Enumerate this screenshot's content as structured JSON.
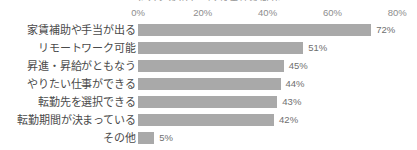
{
  "chart_data": {
    "type": "bar",
    "orientation": "horizontal",
    "title": "たらくないで…べき条件は何か",
    "xlabel": "",
    "ylabel": "",
    "xlim": [
      0,
      80
    ],
    "grid": false,
    "legend": null,
    "value_suffix": "%",
    "categories": [
      "家賃補助や手当が出る",
      "リモートワーク可能",
      "昇進・昇給がともなう",
      "やりたい仕事ができる",
      "転勤先を選択できる",
      "転勤期間が決まっている",
      "その他"
    ],
    "values": [
      72,
      51,
      45,
      44,
      43,
      42,
      5
    ],
    "value_labels": [
      "72%",
      "51%",
      "45%",
      "44%",
      "43%",
      "42%",
      "5%"
    ],
    "xticks": [
      0,
      20,
      40,
      60,
      80
    ],
    "xtick_labels": [
      "0%",
      "20%",
      "40%",
      "60%",
      "80%"
    ],
    "colors": {
      "bar": "#a9a9a9",
      "background": "#ffffff",
      "category_text": "#4a4a4a",
      "value_text": "#6f6f6f",
      "tick_text": "#8d8d8d"
    }
  }
}
